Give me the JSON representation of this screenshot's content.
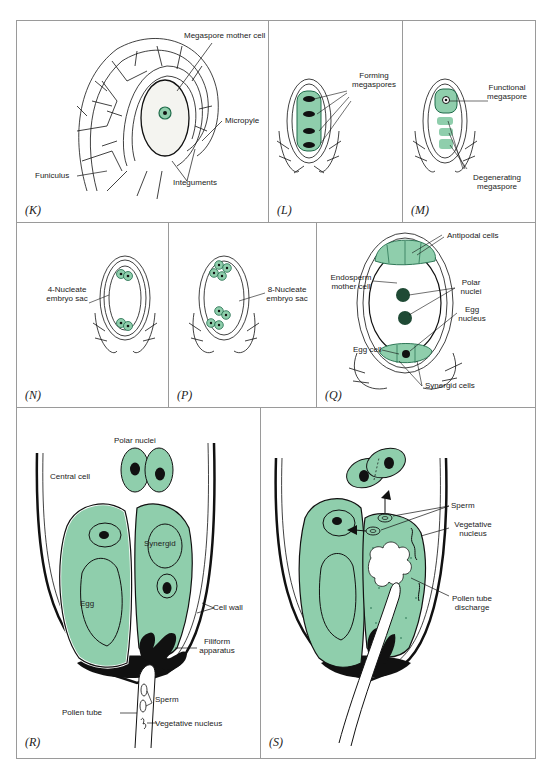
{
  "figure": {
    "colors": {
      "green_fill": "#8fceac",
      "green_dark": "#1f6b4a",
      "ink": "#111111",
      "border": "#9a9a9a"
    },
    "panels": {
      "K": {
        "label": "(K)",
        "annotations": {
          "megaspore_mother_cell": "Megaspore mother cell",
          "micropyle": "Micropyle",
          "funiculus": "Funiculus",
          "integuments": "Integuments"
        }
      },
      "L": {
        "label": "(L)",
        "annotations": {
          "forming_megaspores": "Forming megaspores"
        }
      },
      "M": {
        "label": "(M)",
        "annotations": {
          "functional_megaspore": "Functional megaspore",
          "degenerating_megaspore": "Degenerating megaspore"
        }
      },
      "N": {
        "label": "(N)",
        "annotations": {
          "four_nucleate": "4-Nucleate embryo sac"
        }
      },
      "P": {
        "label": "(P)",
        "annotations": {
          "eight_nucleate": "8-Nucleate embryo sac"
        }
      },
      "Q": {
        "label": "(Q)",
        "annotations": {
          "antipodal_cells": "Antipodal cells",
          "endosperm_mother_cell": "Endosperm mother cell",
          "polar_nuclei": "Polar nuclei",
          "egg_nucleus": "Egg nucleus",
          "egg_cell": "Egg cell",
          "synergid_cells": "Synergid cells"
        }
      },
      "R": {
        "label": "(R)",
        "annotations": {
          "polar_nuclei": "Polar nuclei",
          "central_cell": "Central cell",
          "synergid": "Synergid",
          "egg": "Egg",
          "cell_wall": "Cell wall",
          "filiform_apparatus": "Filiform apparatus",
          "sperm": "Sperm",
          "pollen_tube": "Pollen tube",
          "vegetative_nucleus": "Vegetative nucleus"
        }
      },
      "S": {
        "label": "(S)",
        "annotations": {
          "sperm": "Sperm",
          "vegetative_nucleus": "Vegetative nucleus",
          "pollen_tube_discharge": "Pollen tube discharge"
        }
      }
    }
  }
}
